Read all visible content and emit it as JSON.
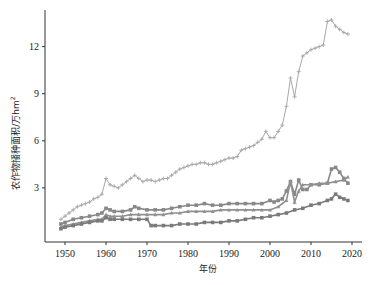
{
  "chart_data": {
    "type": "line",
    "title": "",
    "xlabel": "年份",
    "ylabel": "农作物播种面积/万hm",
    "ylabel_superscript": "2",
    "xlim": [
      1947,
      2022
    ],
    "ylim": [
      0,
      14.5
    ],
    "xticks": [
      1950,
      1960,
      1970,
      1980,
      1990,
      2000,
      2010,
      2020
    ],
    "yticks": [
      3,
      6,
      9,
      12
    ],
    "grid": false,
    "legend": "none",
    "series": [
      {
        "name": "series-1-cross",
        "marker": "cross",
        "color": "#a8a8a8",
        "x": [
          1949,
          1950,
          1951,
          1952,
          1953,
          1954,
          1955,
          1956,
          1957,
          1958,
          1959,
          1960,
          1961,
          1962,
          1963,
          1964,
          1965,
          1966,
          1967,
          1968,
          1969,
          1970,
          1971,
          1972,
          1973,
          1974,
          1975,
          1976,
          1977,
          1978,
          1979,
          1980,
          1981,
          1982,
          1983,
          1984,
          1985,
          1986,
          1987,
          1988,
          1989,
          1990,
          1991,
          1992,
          1993,
          1994,
          1995,
          1996,
          1997,
          1998,
          1999,
          2000,
          2001,
          2002,
          2003,
          2004,
          2005,
          2006,
          2007,
          2008,
          2009,
          2010,
          2011,
          2012,
          2013,
          2014,
          2015,
          2016,
          2017,
          2018,
          2019
        ],
        "values": [
          1.0,
          1.2,
          1.4,
          1.6,
          1.8,
          1.9,
          2.0,
          2.1,
          2.3,
          2.4,
          2.6,
          3.6,
          3.2,
          3.1,
          3.0,
          3.2,
          3.4,
          3.6,
          3.8,
          3.6,
          3.4,
          3.5,
          3.5,
          3.4,
          3.5,
          3.6,
          3.6,
          3.8,
          4.0,
          4.2,
          4.3,
          4.4,
          4.5,
          4.5,
          4.6,
          4.6,
          4.5,
          4.5,
          4.6,
          4.7,
          4.8,
          4.9,
          4.9,
          5.0,
          5.4,
          5.5,
          5.6,
          5.7,
          5.9,
          6.1,
          6.6,
          6.2,
          6.2,
          6.6,
          7.0,
          8.2,
          10.0,
          8.8,
          10.4,
          11.4,
          11.6,
          11.8,
          11.9,
          12.0,
          12.1,
          13.6,
          13.7,
          13.3,
          13.1,
          12.9,
          12.8
        ]
      },
      {
        "name": "series-2-square-upper",
        "marker": "square",
        "color": "#888888",
        "x": [
          1949,
          1950,
          1952,
          1954,
          1956,
          1958,
          1959,
          1960,
          1961,
          1962,
          1964,
          1966,
          1967,
          1968,
          1970,
          1972,
          1974,
          1976,
          1978,
          1980,
          1982,
          1984,
          1986,
          1988,
          1990,
          1992,
          1994,
          1996,
          1998,
          2000,
          2001,
          2002,
          2003,
          2004,
          2005,
          2006,
          2007,
          2008,
          2009,
          2010,
          2012,
          2014,
          2015,
          2016,
          2017,
          2018,
          2019
        ],
        "values": [
          0.7,
          0.8,
          1.0,
          1.1,
          1.2,
          1.3,
          1.4,
          1.7,
          1.6,
          1.5,
          1.5,
          1.6,
          1.8,
          1.7,
          1.6,
          1.6,
          1.6,
          1.7,
          1.8,
          1.9,
          1.9,
          2.0,
          1.9,
          1.9,
          2.0,
          2.0,
          2.0,
          2.0,
          2.0,
          2.2,
          2.1,
          2.2,
          2.3,
          2.8,
          3.4,
          2.6,
          3.5,
          2.9,
          2.9,
          3.2,
          3.2,
          3.3,
          4.2,
          4.3,
          4.0,
          3.6,
          3.3
        ]
      },
      {
        "name": "series-3-triangle",
        "marker": "triangle",
        "color": "#909090",
        "x": [
          1949,
          1950,
          1952,
          1954,
          1956,
          1958,
          1959,
          1960,
          1961,
          1962,
          1964,
          1966,
          1968,
          1970,
          1972,
          1974,
          1976,
          1978,
          1980,
          1982,
          1984,
          1986,
          1988,
          1990,
          1992,
          1994,
          1996,
          1998,
          2000,
          2002,
          2004,
          2005,
          2006,
          2007,
          2008,
          2010,
          2012,
          2014,
          2016,
          2018,
          2019
        ],
        "values": [
          0.5,
          0.6,
          0.7,
          0.8,
          0.9,
          1.0,
          1.0,
          1.3,
          1.2,
          1.2,
          1.2,
          1.3,
          1.3,
          1.3,
          1.3,
          1.3,
          1.4,
          1.4,
          1.5,
          1.5,
          1.5,
          1.5,
          1.6,
          1.6,
          1.6,
          1.6,
          1.6,
          1.6,
          1.6,
          1.8,
          2.2,
          3.4,
          2.1,
          2.8,
          3.2,
          3.2,
          3.3,
          3.3,
          3.4,
          3.5,
          3.7
        ]
      },
      {
        "name": "series-4-square-lower",
        "marker": "square",
        "color": "#7a7a7a",
        "x": [
          1949,
          1950,
          1952,
          1954,
          1956,
          1958,
          1959,
          1960,
          1961,
          1962,
          1964,
          1966,
          1968,
          1970,
          1971,
          1972,
          1974,
          1976,
          1978,
          1980,
          1982,
          1984,
          1986,
          1988,
          1990,
          1992,
          1994,
          1996,
          1998,
          2000,
          2002,
          2004,
          2006,
          2008,
          2010,
          2012,
          2014,
          2015,
          2016,
          2017,
          2018,
          2019
        ],
        "values": [
          0.4,
          0.5,
          0.6,
          0.7,
          0.8,
          0.9,
          0.9,
          1.1,
          1.0,
          1.0,
          1.0,
          1.0,
          1.0,
          1.0,
          0.6,
          0.6,
          0.6,
          0.6,
          0.7,
          0.7,
          0.7,
          0.8,
          0.8,
          0.8,
          0.9,
          0.9,
          1.0,
          1.1,
          1.1,
          1.2,
          1.3,
          1.4,
          1.6,
          1.7,
          1.9,
          2.0,
          2.2,
          2.3,
          2.6,
          2.4,
          2.3,
          2.2
        ]
      }
    ]
  }
}
